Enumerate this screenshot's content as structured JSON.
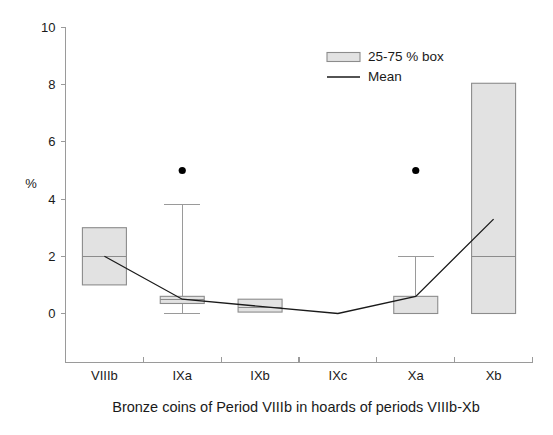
{
  "chart_data": {
    "type": "box",
    "title": "",
    "caption": "Bronze coins of Period VIIIb in hoards of periods VIIIb-Xb",
    "xlabel": "",
    "ylabel": "%",
    "categories": [
      "VIIIb",
      "IXa",
      "IXb",
      "IXc",
      "Xa",
      "Xb"
    ],
    "ylim": [
      0,
      10
    ],
    "yticks": [
      0,
      2,
      4,
      6,
      8,
      10
    ],
    "ytick_labels": [
      "0",
      "2",
      "4",
      "6",
      "8",
      "10"
    ],
    "grid": false,
    "legend_position": "top-right",
    "legend": [
      {
        "label": "25-75 % box",
        "marker": "box-swatch"
      },
      {
        "label": "Mean",
        "marker": "line"
      }
    ],
    "boxes": [
      {
        "category": "VIIIb",
        "q1": 1.0,
        "q3": 3.0,
        "median": 2.0,
        "whisker_low": 1.0,
        "whisker_high": 3.0,
        "mean": 2.0,
        "outliers": []
      },
      {
        "category": "IXa",
        "q1": 0.35,
        "q3": 0.6,
        "median": 0.5,
        "whisker_low": 0.0,
        "whisker_high": 3.8,
        "mean": 0.5,
        "outliers": [
          5.0
        ]
      },
      {
        "category": "IXb",
        "q1": 0.05,
        "q3": 0.5,
        "median": 0.2,
        "whisker_low": 0.05,
        "whisker_high": 0.5,
        "mean": 0.25,
        "outliers": []
      },
      {
        "category": "IXc",
        "q1": 0.0,
        "q3": 0.0,
        "median": 0.0,
        "whisker_low": 0.0,
        "whisker_high": 0.0,
        "mean": 0.0,
        "outliers": []
      },
      {
        "category": "Xa",
        "q1": 0.0,
        "q3": 0.6,
        "median": 0.0,
        "whisker_low": 0.0,
        "whisker_high": 2.0,
        "mean": 0.6,
        "outliers": [
          5.0
        ]
      },
      {
        "category": "Xb",
        "q1": 0.0,
        "q3": 8.05,
        "median": 2.0,
        "whisker_low": 0.0,
        "whisker_high": 8.05,
        "mean": 3.3,
        "outliers": []
      }
    ],
    "mean_series": {
      "name": "Mean",
      "x": [
        "VIIIb",
        "IXa",
        "IXb",
        "IXc",
        "Xa",
        "Xb"
      ],
      "values": [
        2.0,
        0.5,
        0.25,
        0.0,
        0.6,
        3.3
      ]
    },
    "colors": {
      "box_fill": "#e2e2e2",
      "box_stroke": "#8c8c8c",
      "mean_line": "#1a1a1a",
      "axis": "#9a9a9a",
      "text": "#1a1a1a",
      "outlier": "#000000"
    }
  }
}
